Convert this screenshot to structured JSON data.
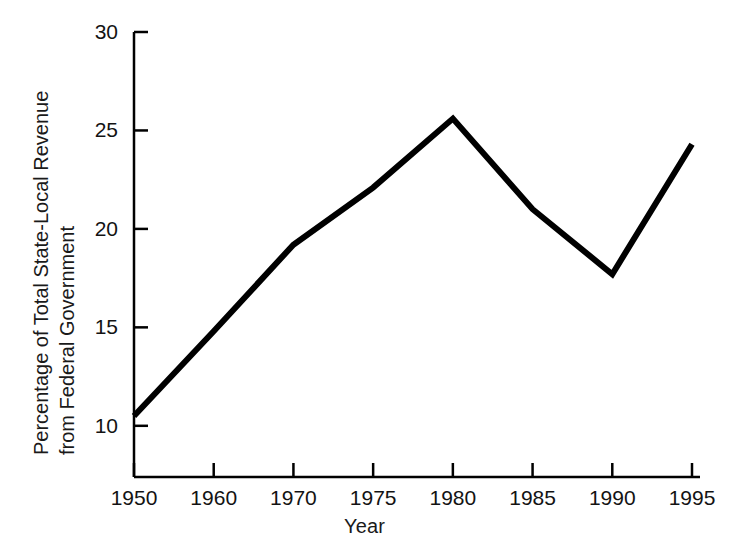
{
  "chart_data": {
    "type": "line",
    "title": "",
    "xlabel": "Year",
    "ylabel": "Percentage of Total State-Local Revenue from Federal Government",
    "ylabel_lines": [
      "Percentage of Total State-Local Revenue",
      "from Federal Government"
    ],
    "categories": [
      "1950",
      "1960",
      "1970",
      "1975",
      "1980",
      "1985",
      "1990",
      "1995"
    ],
    "values": [
      10.5,
      14.8,
      19.2,
      22.1,
      25.6,
      21.0,
      17.7,
      24.3
    ],
    "series": [
      {
        "name": "Federal share of state-local revenue",
        "values": [
          10.5,
          14.8,
          19.2,
          22.1,
          25.6,
          21.0,
          17.7,
          24.3
        ],
        "color": "#000000"
      }
    ],
    "ytick_labels": [
      "10",
      "15",
      "20",
      "25",
      "30"
    ],
    "ytick_values": [
      10,
      15,
      20,
      25,
      30
    ],
    "ylim": [
      7.4,
      30
    ],
    "grid": false,
    "legend": false,
    "legend_position": "none",
    "line_color": "#000000",
    "line_width": 6,
    "axis_color": "#000000"
  },
  "axes": {
    "x_axis_name": "Year",
    "y_axis_name": "Percentage of Total State-Local Revenue from Federal Government"
  }
}
